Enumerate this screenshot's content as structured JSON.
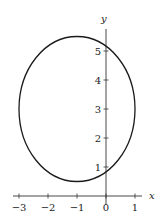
{
  "chart_data": {
    "type": "line",
    "title": "",
    "xlabel": "x",
    "ylabel": "y",
    "xlim": [
      -3.2,
      1.25
    ],
    "ylim": [
      0,
      5.8
    ],
    "grid": false,
    "legend": null,
    "x_ticks": [
      -3,
      -2,
      -1,
      0,
      1
    ],
    "x_tick_labels": [
      "−3",
      "−2",
      "−1",
      "0",
      "1"
    ],
    "y_ticks": [
      1,
      2,
      3,
      4,
      5
    ],
    "y_tick_labels": [
      "1",
      "2",
      "3",
      "4",
      "5"
    ],
    "series": [
      {
        "name": "ellipse",
        "shape": "ellipse",
        "center": [
          -1,
          3
        ],
        "semi_axis_x": 2,
        "semi_axis_y": 2.5,
        "color": "#1a1a1a",
        "extents": {
          "left": -3,
          "right": 1,
          "bottom": 0.5,
          "top": 5.5
        }
      }
    ]
  },
  "axes": {
    "x_label": "x",
    "y_label": "y"
  }
}
